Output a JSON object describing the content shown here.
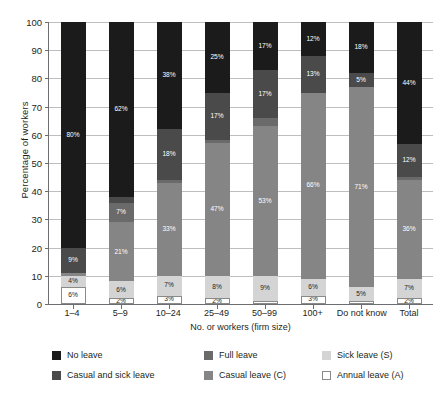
{
  "chart_data": {
    "type": "bar",
    "stacked": true,
    "stack_total": 100,
    "title": "",
    "xlabel": "No. or workers (firm size)",
    "ylabel": "Percentage of workers",
    "ylim": [
      0,
      100
    ],
    "yticks": [
      0,
      10,
      20,
      30,
      40,
      50,
      60,
      70,
      80,
      90,
      100
    ],
    "grid": true,
    "legend_position": "below",
    "categories": [
      "1–4",
      "5–9",
      "10–24",
      "25–49",
      "50–99",
      "100+",
      "Do not know",
      "Total"
    ],
    "series": [
      {
        "name": "Annual leave (A)",
        "key": "annual",
        "color": "#ffffff",
        "values": [
          6,
          2,
          3,
          2,
          1,
          3,
          1,
          2
        ],
        "labels": [
          "6%",
          "2%",
          "3%",
          "2%",
          "",
          "3%",
          "",
          "2%"
        ]
      },
      {
        "name": "Sick leave (S)",
        "key": "sick",
        "color": "#d4d4d4",
        "values": [
          4,
          6,
          7,
          8,
          9,
          6,
          5,
          7
        ],
        "labels": [
          "4%",
          "6%",
          "7%",
          "8%",
          "9%",
          "6%",
          "5%",
          "7%"
        ]
      },
      {
        "name": "Casual leave (C)",
        "key": "casual",
        "color": "#858585",
        "values": [
          1,
          21,
          33,
          47,
          53,
          66,
          71,
          36
        ],
        "labels": [
          "",
          "21%",
          "33%",
          "47%",
          "53%",
          "66%",
          "71%",
          "36%"
        ]
      },
      {
        "name": "Full leave",
        "key": "full_leave",
        "color": "#6a6a6a",
        "values": [
          0,
          7,
          1,
          1,
          3,
          0,
          0,
          1
        ],
        "labels": [
          "",
          "7%",
          "",
          "",
          "",
          "",
          "",
          ""
        ]
      },
      {
        "name": "Casual and sick leave",
        "key": "casual_and_sick",
        "color": "#4a4a4a",
        "values": [
          9,
          2,
          18,
          17,
          17,
          13,
          5,
          12
        ],
        "labels": [
          "9%",
          "",
          "18%",
          "17%",
          "17%",
          "13%",
          "5%",
          "12%"
        ]
      },
      {
        "name": "No leave",
        "key": "no_leave",
        "color": "#1b1b1b",
        "values": [
          80,
          62,
          38,
          25,
          17,
          12,
          18,
          44
        ],
        "labels": [
          "80%",
          "62%",
          "38%",
          "25%",
          "17%",
          "12%",
          "18%",
          "44%"
        ]
      }
    ]
  },
  "legend": {
    "entries": [
      {
        "label": "No leave",
        "key": "no_leave"
      },
      {
        "label": "Full leave",
        "key": "full_leave"
      },
      {
        "label": "Sick leave (S)",
        "key": "sick"
      },
      {
        "label": "Casual and sick leave",
        "key": "casual_and_sick"
      },
      {
        "label": "Casual leave (C)",
        "key": "casual"
      },
      {
        "label": "Annual leave (A)",
        "key": "annual"
      }
    ]
  }
}
